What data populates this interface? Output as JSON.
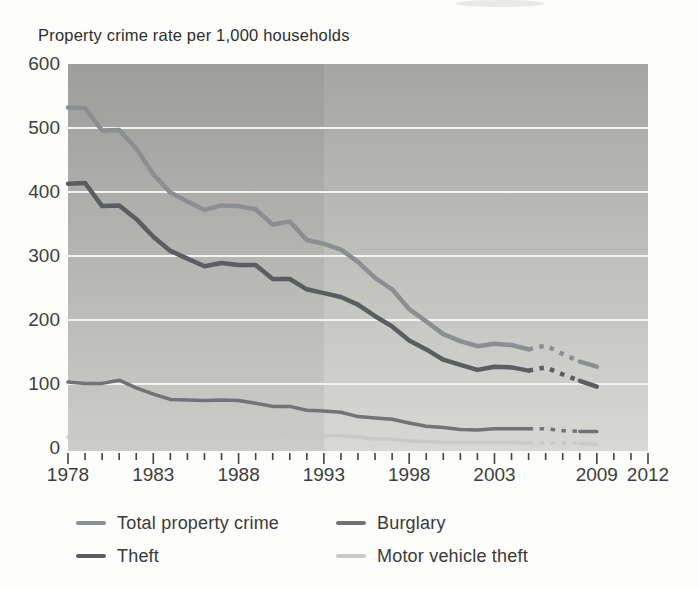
{
  "chart_data": {
    "type": "line",
    "title": "Property crime rate per 1,000 households",
    "x": [
      1978,
      1979,
      1980,
      1981,
      1982,
      1983,
      1984,
      1985,
      1986,
      1987,
      1988,
      1989,
      1990,
      1991,
      1992,
      1993,
      1994,
      1995,
      1996,
      1997,
      1998,
      1999,
      2000,
      2001,
      2002,
      2003,
      2004,
      2005,
      2006,
      2007,
      2008,
      2009
    ],
    "xlim": [
      1978,
      2012
    ],
    "ylim": [
      0,
      600
    ],
    "yticks": [
      0,
      100,
      200,
      300,
      400,
      500,
      600
    ],
    "x_axis_labels": [
      1978,
      1983,
      1988,
      1993,
      1998,
      2003,
      2009,
      2012
    ],
    "grid": "horizontal-white-lines",
    "legend_position": "below-chart-two-columns",
    "dash_start_year": 2005,
    "dash_end_year": 2008,
    "dash_note": "lines drawn dashed between 2005 and 2008 segment",
    "pre_redesign_shade_end_year": 1993,
    "series": [
      {
        "name": "Total property crime",
        "color": "#8b8e92",
        "width": 4.5,
        "values": [
          532,
          531,
          496,
          497,
          468,
          428,
          399,
          385,
          372,
          379,
          378,
          373,
          349,
          354,
          325,
          319,
          310,
          291,
          266,
          248,
          217,
          198,
          178,
          167,
          159,
          163,
          161,
          154,
          160,
          147,
          135,
          127
        ]
      },
      {
        "name": "Theft",
        "color": "#5a5e62",
        "width": 4.5,
        "values": [
          413,
          414,
          378,
          379,
          358,
          330,
          308,
          296,
          284,
          289,
          286,
          286,
          264,
          264,
          248,
          242,
          236,
          224,
          206,
          190,
          168,
          154,
          138,
          130,
          122,
          127,
          126,
          121,
          126,
          115,
          105,
          96
        ]
      },
      {
        "name": "Burglary",
        "color": "#717377",
        "width": 3.5,
        "values": [
          103,
          101,
          101,
          106,
          94,
          84,
          76,
          75,
          74,
          75,
          74,
          70,
          65,
          65,
          59,
          58,
          56,
          49,
          47,
          45,
          39,
          34,
          32,
          29,
          28,
          30,
          30,
          30,
          30,
          27,
          26,
          26
        ]
      },
      {
        "name": "Motor vehicle theft",
        "color": "#c9cac7",
        "width": 3.5,
        "values": [
          17,
          18,
          17,
          17,
          16,
          15,
          15,
          14,
          15,
          16,
          18,
          19,
          21,
          22,
          20,
          19,
          19,
          17,
          14,
          14,
          11,
          10,
          9,
          9,
          9,
          9,
          9,
          8,
          8,
          8,
          7,
          6
        ]
      }
    ],
    "axis_tick_color": "#424242",
    "gridline_color": "#f3f3f0"
  },
  "legend_order_note": "row-major: Total property crime, Burglary, Theft, Motor vehicle theft"
}
